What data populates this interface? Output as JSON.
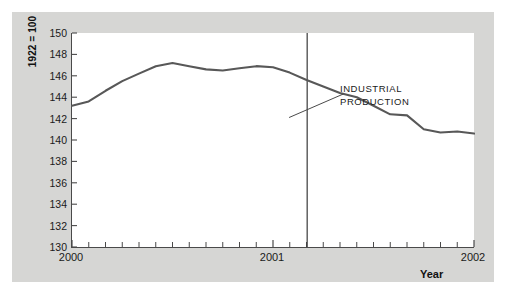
{
  "figure": {
    "background": "#ffffff",
    "panel_color": "#d6d6d4",
    "plot_background": "#ffffff",
    "axis_color": "#4a4a4a",
    "line_color": "#585858",
    "annotation_line1": "INDUSTRIAL",
    "annotation_line2": "PRODUCTION",
    "y_axis_title": "1922 = 100",
    "x_axis_title": "Year"
  },
  "chart_data": {
    "type": "line",
    "title": "",
    "xlabel": "Year",
    "ylabel": "1922 = 100",
    "ylim": [
      130,
      150
    ],
    "xlim": [
      2000.0,
      2002.0
    ],
    "grid": false,
    "legend": null,
    "yticks": [
      130,
      132,
      134,
      136,
      138,
      140,
      142,
      144,
      146,
      148,
      150
    ],
    "xticks": [
      2000,
      2001,
      2002
    ],
    "xtick_labels": [
      "2000",
      "2001",
      "2002"
    ],
    "minor_xticks_per_year": 12,
    "annotations": [
      {
        "text": "INDUSTRIAL PRODUCTION",
        "x": 2001.35,
        "y": 144.3,
        "leader_from_x": 2001.08,
        "leader_from_y": 142.1
      }
    ],
    "reference_line": {
      "orientation": "vertical",
      "x": 2001.17,
      "label": ""
    },
    "series": [
      {
        "name": "Industrial Production",
        "color": "#585858",
        "x": [
          2000.0,
          2000.083,
          2000.167,
          2000.25,
          2000.333,
          2000.417,
          2000.5,
          2000.583,
          2000.667,
          2000.75,
          2000.833,
          2000.917,
          2001.0,
          2001.083,
          2001.167,
          2001.25,
          2001.333,
          2001.417,
          2001.5,
          2001.583,
          2001.667,
          2001.75,
          2001.833,
          2001.917,
          2002.0
        ],
        "values": [
          143.2,
          143.6,
          144.6,
          145.5,
          146.2,
          146.9,
          147.2,
          146.9,
          146.6,
          146.5,
          146.7,
          146.9,
          146.8,
          146.3,
          145.6,
          145.0,
          144.4,
          144.0,
          143.2,
          142.4,
          142.3,
          141.0,
          140.7,
          140.8,
          140.6
        ],
        "values_continued_x": [
          2002.0
        ],
        "note": "monthly index, 1922 = 100"
      }
    ],
    "series_full": {
      "name": "Industrial Production",
      "x_months": [
        "2000-01",
        "2000-02",
        "2000-03",
        "2000-04",
        "2000-05",
        "2000-06",
        "2000-07",
        "2000-08",
        "2000-09",
        "2000-10",
        "2000-11",
        "2000-12",
        "2001-01",
        "2001-02",
        "2001-03",
        "2001-04",
        "2001-05",
        "2001-06",
        "2001-07",
        "2001-08",
        "2001-09",
        "2001-10",
        "2001-11",
        "2001-12",
        "2002-01"
      ],
      "y": [
        143.2,
        143.6,
        144.6,
        145.5,
        146.2,
        146.9,
        147.2,
        146.9,
        146.6,
        146.5,
        146.7,
        146.9,
        146.8,
        146.3,
        145.6,
        145.0,
        144.4,
        144.0,
        143.2,
        142.4,
        142.3,
        141.0,
        140.7,
        140.8,
        140.6
      ]
    }
  }
}
